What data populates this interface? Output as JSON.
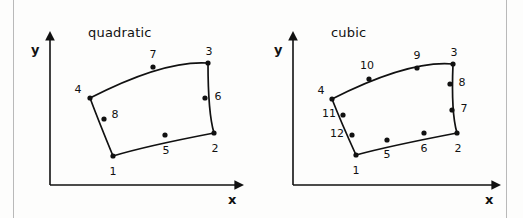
{
  "figure": {
    "kind": "finite-element-node-numbering-diagram",
    "background_color": "#fdfdfc",
    "stroke_color": "#111111"
  },
  "panels": [
    {
      "id": "quadratic",
      "title": "quadratic",
      "axes": {
        "x_label": "x",
        "y_label": "y",
        "origin": [
          34,
          185
        ],
        "x_arrow_end": [
          227,
          185
        ],
        "y_arrow_end": [
          34,
          32
        ]
      },
      "element": {
        "corner_nodes": [
          "1",
          "2",
          "3",
          "4"
        ],
        "mid_nodes": [
          "5",
          "6",
          "7",
          "8"
        ],
        "node_count": 8,
        "outline_path": "M 97 156 Q 130 146 198 133 Q 192 113 192 63 Q 148 60 74 98 Q 83 122 97 156 Z"
      },
      "nodes": [
        {
          "label": "1",
          "x": 97,
          "y": 156,
          "lx": 97,
          "ly": 171
        },
        {
          "label": "2",
          "x": 198,
          "y": 133,
          "lx": 199,
          "ly": 148
        },
        {
          "label": "3",
          "x": 192,
          "y": 63,
          "lx": 193,
          "ly": 51
        },
        {
          "label": "4",
          "x": 74,
          "y": 98,
          "lx": 62,
          "ly": 89
        },
        {
          "label": "5",
          "x": 149,
          "y": 135,
          "lx": 150,
          "ly": 150
        },
        {
          "label": "6",
          "x": 189,
          "y": 98,
          "lx": 202,
          "ly": 96
        },
        {
          "label": "7",
          "x": 137,
          "y": 67,
          "lx": 137,
          "ly": 54
        },
        {
          "label": "8",
          "x": 88,
          "y": 119,
          "lx": 99,
          "ly": 114
        }
      ]
    },
    {
      "id": "cubic",
      "title": "cubic",
      "axes": {
        "x_label": "x",
        "y_label": "y",
        "origin": [
          34,
          185
        ],
        "x_arrow_end": [
          241,
          185
        ],
        "y_arrow_end": [
          34,
          32
        ]
      },
      "element": {
        "corner_nodes": [
          "1",
          "2",
          "3",
          "4"
        ],
        "mid_nodes": [
          "5",
          "6",
          "7",
          "8",
          "9",
          "10",
          "11",
          "12"
        ],
        "node_count": 12,
        "outline_path": "M 97 155 Q 130 146 198 133 Q 192 113 194 64 Q 150 60 73 99 Q 82 122 97 155 Z"
      },
      "nodes": [
        {
          "label": "1",
          "x": 97,
          "y": 155,
          "lx": 97,
          "ly": 170
        },
        {
          "label": "2",
          "x": 198,
          "y": 133,
          "lx": 199,
          "ly": 148
        },
        {
          "label": "3",
          "x": 194,
          "y": 64,
          "lx": 195,
          "ly": 52
        },
        {
          "label": "4",
          "x": 73,
          "y": 99,
          "lx": 62,
          "ly": 90
        },
        {
          "label": "5",
          "x": 128,
          "y": 140,
          "lx": 128,
          "ly": 154
        },
        {
          "label": "6",
          "x": 165,
          "y": 133,
          "lx": 165,
          "ly": 148
        },
        {
          "label": "7",
          "x": 193,
          "y": 110,
          "lx": 205,
          "ly": 108
        },
        {
          "label": "8",
          "x": 191,
          "y": 84,
          "lx": 203,
          "ly": 82
        },
        {
          "label": "9",
          "x": 158,
          "y": 68,
          "lx": 158,
          "ly": 55
        },
        {
          "label": "10",
          "x": 110,
          "y": 79,
          "lx": 108,
          "ly": 65
        },
        {
          "label": "11",
          "x": 84,
          "y": 115,
          "lx": 70,
          "ly": 113
        },
        {
          "label": "12",
          "x": 93,
          "y": 135,
          "lx": 78,
          "ly": 133
        }
      ]
    }
  ]
}
